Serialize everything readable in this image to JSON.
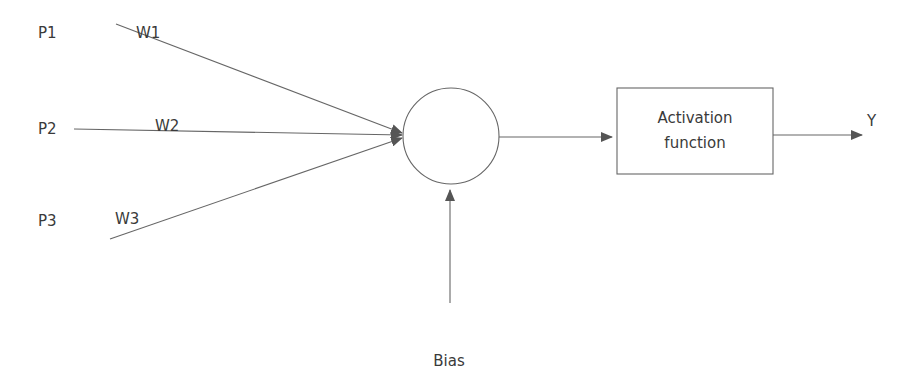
{
  "diagram": {
    "type": "perceptron",
    "inputs": [
      {
        "label": "P1",
        "weight": "W1"
      },
      {
        "label": "P2",
        "weight": "W2"
      },
      {
        "label": "P3",
        "weight": "W3"
      }
    ],
    "summation_node": "",
    "activation_box": {
      "line1": "Activation",
      "line2": "function"
    },
    "output": "Y",
    "bias": "Bias",
    "colors": {
      "stroke": "#555555",
      "text": "#3a3a3a",
      "background": "#ffffff"
    }
  }
}
